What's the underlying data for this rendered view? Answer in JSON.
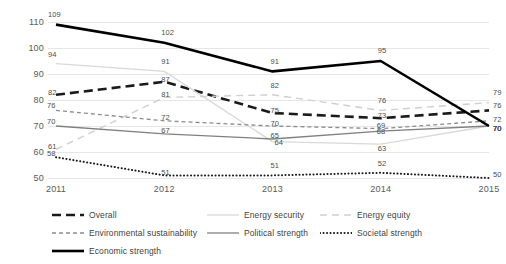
{
  "chart_data": {
    "type": "line",
    "title": "",
    "xlabel": "",
    "ylabel": "",
    "categories": [
      "2011",
      "2012",
      "2013",
      "2014",
      "2015"
    ],
    "ylim": [
      50,
      110
    ],
    "ytick_step": 10,
    "yticks": [
      "110",
      "100",
      "90",
      "80",
      "70",
      "60",
      "50"
    ],
    "grid": true,
    "grid_axis": "y",
    "legend_position": "bottom",
    "data_labels": true,
    "series": [
      {
        "name": "Overall",
        "values": [
          82,
          87,
          75,
          73,
          76
        ],
        "color": "#1a1a1a",
        "style": "dashed-thick"
      },
      {
        "name": "Energy security",
        "values": [
          94,
          91,
          64,
          63,
          70
        ],
        "color": "#d9d9d9",
        "style": "solid"
      },
      {
        "name": "Energy equity",
        "values": [
          61,
          81,
          82,
          76,
          79
        ],
        "color": "#cfcfcf",
        "style": "dashed"
      },
      {
        "name": "Environmental sustainability",
        "values": [
          76,
          72,
          70,
          69,
          72
        ],
        "color": "#8c8c8c",
        "style": "dashed-small"
      },
      {
        "name": "Political strength",
        "values": [
          70,
          67,
          65,
          68,
          70
        ],
        "color": "#808080",
        "style": "solid"
      },
      {
        "name": "Societal strength",
        "values": [
          58,
          51,
          51,
          52,
          50
        ],
        "color": "#1a1a1a",
        "style": "dotted"
      },
      {
        "name": "Economic strength",
        "values": [
          109,
          102,
          91,
          95,
          70
        ],
        "color": "#000000",
        "style": "solid-thick"
      }
    ]
  },
  "legend": {
    "items": [
      {
        "label": "Overall"
      },
      {
        "label": "Energy security"
      },
      {
        "label": "Energy equity"
      },
      {
        "label": "Environmental sustainability"
      },
      {
        "label": "Political strength"
      },
      {
        "label": "Societal strength"
      },
      {
        "label": "Economic strength"
      }
    ]
  }
}
